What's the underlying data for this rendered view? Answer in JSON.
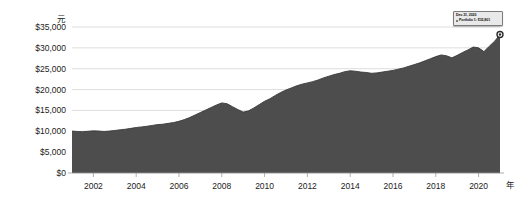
{
  "chart_data": {
    "type": "area",
    "title": "",
    "subtitle": "",
    "xlabel": "年",
    "ylabel": "元",
    "y_unit": "元",
    "x_unit": "年",
    "grid": true,
    "legend": null,
    "ylim": [
      0,
      35000
    ],
    "xlim": [
      2001,
      2021
    ],
    "ytick_labels": [
      "$35,000",
      "$30,000",
      "$25,000",
      "$20,000",
      "$15,000",
      "$10,000",
      "$5,000",
      "$0"
    ],
    "ytick_values": [
      35000,
      30000,
      25000,
      20000,
      15000,
      10000,
      5000,
      0
    ],
    "xtick_labels": [
      "2002",
      "2004",
      "2006",
      "2008",
      "2010",
      "2012",
      "2014",
      "2016",
      "2018",
      "2020"
    ],
    "xtick_values": [
      2002,
      2004,
      2006,
      2008,
      2010,
      2012,
      2014,
      2016,
      2018,
      2020
    ],
    "series": [
      {
        "name": "Portfolio 1",
        "color": "#4d4d4d",
        "x": [
          2001.0,
          2001.25,
          2001.5,
          2001.75,
          2002.0,
          2002.25,
          2002.5,
          2002.75,
          2003.0,
          2003.25,
          2003.5,
          2003.75,
          2004.0,
          2004.25,
          2004.5,
          2004.75,
          2005.0,
          2005.25,
          2005.5,
          2005.75,
          2006.0,
          2006.25,
          2006.5,
          2006.75,
          2007.0,
          2007.25,
          2007.5,
          2007.75,
          2008.0,
          2008.25,
          2008.5,
          2008.75,
          2009.0,
          2009.25,
          2009.5,
          2009.75,
          2010.0,
          2010.25,
          2010.5,
          2010.75,
          2011.0,
          2011.25,
          2011.5,
          2011.75,
          2012.0,
          2012.25,
          2012.5,
          2012.75,
          2013.0,
          2013.25,
          2013.5,
          2013.75,
          2014.0,
          2014.25,
          2014.5,
          2014.75,
          2015.0,
          2015.25,
          2015.5,
          2015.75,
          2016.0,
          2016.25,
          2016.5,
          2016.75,
          2017.0,
          2017.25,
          2017.5,
          2017.75,
          2018.0,
          2018.25,
          2018.5,
          2018.75,
          2019.0,
          2019.25,
          2019.5,
          2019.75,
          2020.0,
          2020.25,
          2020.5,
          2020.75,
          2021.0
        ],
        "values": [
          10050,
          9950,
          9900,
          10000,
          10100,
          10050,
          9950,
          10050,
          10200,
          10350,
          10500,
          10700,
          10900,
          11050,
          11200,
          11400,
          11600,
          11700,
          11900,
          12100,
          12400,
          12800,
          13300,
          13900,
          14500,
          15100,
          15700,
          16300,
          16800,
          16600,
          15900,
          15200,
          14600,
          14900,
          15600,
          16400,
          17200,
          17800,
          18600,
          19300,
          19900,
          20400,
          20900,
          21300,
          21600,
          21900,
          22300,
          22800,
          23200,
          23600,
          23900,
          24300,
          24500,
          24400,
          24200,
          24100,
          23900,
          24000,
          24200,
          24400,
          24600,
          24900,
          25200,
          25600,
          26000,
          26400,
          26900,
          27400,
          27900,
          28300,
          28100,
          27600,
          28200,
          28900,
          29500,
          30200,
          30000,
          29100,
          30400,
          31600,
          33200
        ]
      }
    ],
    "annotation": {
      "date": "Dec 31, 2020",
      "series_label": "Portfolio 1:",
      "value_label": "$32,801",
      "marker_x": 2021.0,
      "marker_y": 33200
    }
  }
}
